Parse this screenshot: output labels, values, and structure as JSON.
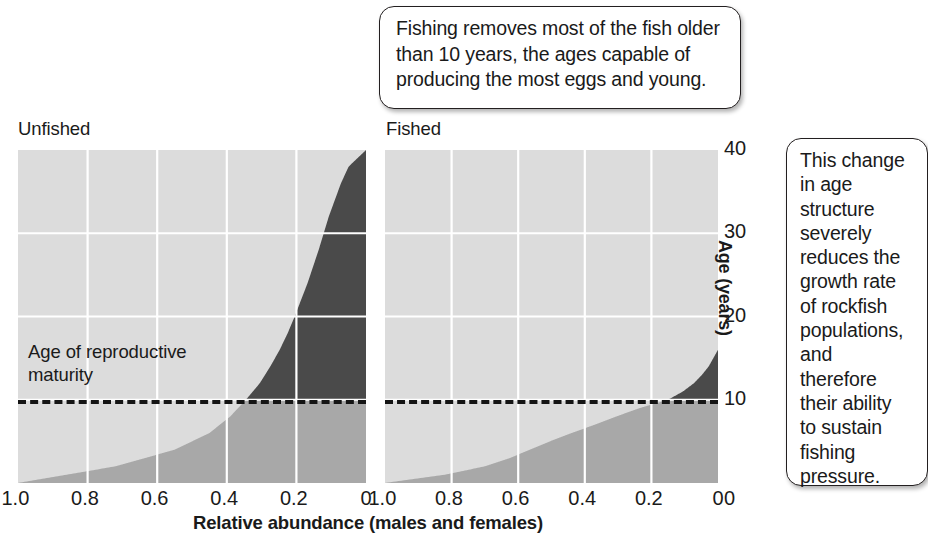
{
  "figure": {
    "panels": [
      {
        "key": "unfished",
        "title": "Unfished"
      },
      {
        "key": "fished",
        "title": "Fished"
      }
    ],
    "maturity_annotation": "Age of reproductive\nmaturity",
    "callout_top": "Fishing removes most of the fish older\nthan 10  years, the ages capable of\nproducing the most eggs and young.",
    "callout_right": "This change\nin age\nstructure\nseverely\nreduces the\ngrowth rate\nof rockfish\npopulations,\nand\ntherefore\ntheir ability\nto sustain\nfishing\npressure.",
    "colors": {
      "plot_background": "#dcdcdc",
      "immature_fill": "#a8a8a8",
      "mature_fill": "#4a4a4a",
      "gridline": "#ffffff",
      "maturity_line": "#141414",
      "text": "#1a1a1a"
    }
  },
  "chart_data": {
    "type": "area",
    "title": "",
    "xlabel": "Relative abundance (males and females)",
    "ylabel": "Age (years)",
    "xlim": [
      1.0,
      0.0
    ],
    "ylim": [
      0,
      40
    ],
    "xticks": [
      "1.0",
      "0.8",
      "0.6",
      "0.4",
      "0.2",
      "0"
    ],
    "yticks": [
      "40",
      "30",
      "20",
      "10",
      "0"
    ],
    "xtick_values": [
      1.0,
      0.8,
      0.6,
      0.4,
      0.2,
      0.0
    ],
    "ytick_values": [
      40,
      30,
      20,
      10,
      0
    ],
    "grid": true,
    "legend": "none",
    "maturity_age": 10,
    "annotations": [
      {
        "text": "Age of reproductive maturity",
        "age": 10,
        "style": "dashed-line"
      }
    ],
    "series": [
      {
        "name": "Unfished",
        "panel": "unfished",
        "description": "Age-structure profile of an unfished rockfish population: abundance declines smoothly with age, with substantial numbers of fish older than 10 years reaching 40 years.",
        "ages": [
          0,
          2,
          4,
          6,
          8,
          10,
          12,
          14,
          16,
          18,
          20,
          24,
          28,
          32,
          36,
          38,
          40
        ],
        "abundance": [
          1.0,
          0.72,
          0.55,
          0.45,
          0.39,
          0.345,
          0.305,
          0.275,
          0.248,
          0.225,
          0.205,
          0.168,
          0.136,
          0.107,
          0.072,
          0.05,
          0.0
        ]
      },
      {
        "name": "Fished",
        "panel": "fished",
        "description": "Age-structure profile of a fished rockfish population: almost all fish older than 10 years have been removed, truncating the age structure near the age of reproductive maturity.",
        "ages": [
          0,
          1,
          2,
          3,
          4,
          5,
          6,
          7,
          8,
          9,
          10,
          11,
          12,
          13,
          14,
          16
        ],
        "abundance": [
          1.0,
          0.82,
          0.7,
          0.625,
          0.565,
          0.505,
          0.44,
          0.37,
          0.305,
          0.235,
          0.15,
          0.105,
          0.072,
          0.048,
          0.028,
          0.0
        ]
      }
    ]
  }
}
